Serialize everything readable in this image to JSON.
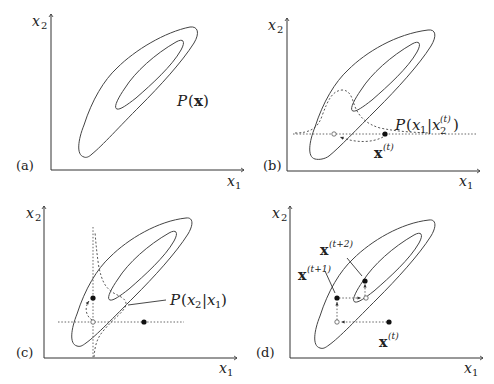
{
  "figure": {
    "panels": [
      {
        "id": "a",
        "panel_label": "(a)",
        "x_axis_label": "x",
        "x_axis_sub": "1",
        "y_axis_label": "x",
        "y_axis_sub": "2",
        "annotation": "P(x)",
        "annotation_parts": {
          "P": "P",
          "open": "(",
          "x": "x",
          "close": ")"
        }
      },
      {
        "id": "b",
        "panel_label": "(b)",
        "x_axis_label": "x",
        "x_axis_sub": "1",
        "y_axis_label": "x",
        "y_axis_sub": "2",
        "annotation_parts": {
          "P": "P",
          "open": "(",
          "x1": "x",
          "x1_sub": "1",
          "bar": "|",
          "x2": "x",
          "x2_sub": "2",
          "x2_sup": "(t)",
          "close": ")"
        },
        "point_label": {
          "x": "x",
          "sup": "(t)"
        }
      },
      {
        "id": "c",
        "panel_label": "(c)",
        "x_axis_label": "x",
        "x_axis_sub": "1",
        "y_axis_label": "x",
        "y_axis_sub": "2",
        "annotation_parts": {
          "P": "P",
          "open": "(",
          "x2": "x",
          "x2_sub": "2",
          "bar": "|",
          "x1": "x",
          "x1_sub": "1",
          "close": ")"
        }
      },
      {
        "id": "d",
        "panel_label": "(d)",
        "x_axis_label": "x",
        "x_axis_sub": "1",
        "y_axis_label": "x",
        "y_axis_sub": "2",
        "point_labels": [
          {
            "x": "x",
            "sup": "(t)"
          },
          {
            "x": "x",
            "sup": "(t+1)"
          },
          {
            "x": "x",
            "sup": "(t+2)"
          }
        ]
      }
    ]
  }
}
